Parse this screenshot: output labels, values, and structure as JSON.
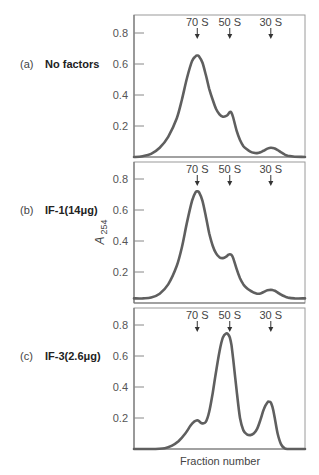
{
  "chart_data": {
    "type": "line",
    "title": "",
    "xlabel": "Fraction number",
    "ylabel": "A254",
    "ylabel_main": "A",
    "ylabel_sub": "254",
    "ylim": [
      0,
      0.9
    ],
    "yticks": [
      0.2,
      0.4,
      0.6,
      0.8
    ],
    "ytick_labels": [
      "0.2",
      "0.4",
      "0.6",
      "0.8"
    ],
    "grid": false,
    "legend": "none",
    "x_range": [
      0,
      100
    ],
    "markers": [
      {
        "label": "70 S",
        "x": 37
      },
      {
        "label": "50 S",
        "x": 56
      },
      {
        "label": "30 S",
        "x": 80
      }
    ],
    "panels": [
      {
        "letter": "(a)",
        "condition": "No factors",
        "x": [
          0,
          5,
          10,
          15,
          20,
          25,
          28,
          31,
          34,
          36,
          37,
          38,
          40,
          42,
          44,
          46,
          48,
          50,
          52,
          54,
          55,
          56,
          57,
          58,
          60,
          62,
          64,
          66,
          68,
          70,
          72,
          74,
          76,
          78,
          80,
          82,
          84,
          86,
          88,
          90,
          94,
          100
        ],
        "y": [
          0.0,
          0.005,
          0.02,
          0.06,
          0.13,
          0.25,
          0.37,
          0.51,
          0.62,
          0.65,
          0.655,
          0.65,
          0.61,
          0.53,
          0.44,
          0.37,
          0.31,
          0.275,
          0.26,
          0.265,
          0.275,
          0.29,
          0.285,
          0.255,
          0.17,
          0.11,
          0.07,
          0.05,
          0.035,
          0.027,
          0.025,
          0.03,
          0.042,
          0.054,
          0.06,
          0.056,
          0.045,
          0.03,
          0.017,
          0.008,
          0.002,
          0.0
        ]
      },
      {
        "letter": "(b)",
        "condition": "IF-1(14μg)",
        "x": [
          0,
          5,
          10,
          15,
          20,
          25,
          28,
          31,
          34,
          36,
          37,
          38,
          40,
          42,
          44,
          46,
          48,
          50,
          52,
          54,
          55,
          56,
          57,
          58,
          60,
          62,
          64,
          66,
          68,
          70,
          72,
          74,
          76,
          78,
          80,
          82,
          84,
          86,
          88,
          90,
          94,
          100
        ],
        "y": [
          0.03,
          0.03,
          0.035,
          0.06,
          0.12,
          0.24,
          0.36,
          0.52,
          0.66,
          0.715,
          0.72,
          0.715,
          0.66,
          0.56,
          0.45,
          0.37,
          0.32,
          0.295,
          0.29,
          0.3,
          0.31,
          0.315,
          0.31,
          0.29,
          0.22,
          0.16,
          0.12,
          0.095,
          0.08,
          0.068,
          0.06,
          0.062,
          0.072,
          0.082,
          0.085,
          0.08,
          0.068,
          0.054,
          0.043,
          0.035,
          0.03,
          0.03
        ]
      },
      {
        "letter": "(c)",
        "condition": "IF-3(2.6μg)",
        "x": [
          0,
          10,
          18,
          22,
          26,
          30,
          33,
          35,
          37,
          38,
          39,
          40,
          42,
          44,
          46,
          48,
          50,
          52,
          54,
          55,
          56,
          57,
          58,
          60,
          62,
          64,
          66,
          68,
          70,
          72,
          74,
          76,
          78,
          79,
          80,
          81,
          82,
          84,
          86,
          88,
          90,
          94,
          100
        ],
        "y": [
          0.0,
          0.0,
          0.005,
          0.02,
          0.05,
          0.1,
          0.15,
          0.175,
          0.185,
          0.18,
          0.17,
          0.165,
          0.175,
          0.24,
          0.36,
          0.5,
          0.63,
          0.72,
          0.745,
          0.74,
          0.72,
          0.67,
          0.58,
          0.38,
          0.2,
          0.12,
          0.095,
          0.09,
          0.1,
          0.13,
          0.19,
          0.26,
          0.3,
          0.305,
          0.3,
          0.27,
          0.22,
          0.1,
          0.03,
          0.005,
          0.0,
          0.0,
          0.0
        ]
      }
    ]
  },
  "figure": {
    "xlabel": "Fraction number",
    "ylabel_main": "A",
    "ylabel_sub": "254",
    "panels": [
      {
        "letter": "(a)",
        "condition": "No factors"
      },
      {
        "letter": "(b)",
        "condition": "IF-1(14μg)"
      },
      {
        "letter": "(c)",
        "condition": "IF-3(2.6μg)"
      }
    ]
  }
}
